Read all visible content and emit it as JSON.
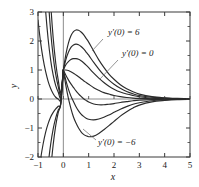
{
  "chart_data": {
    "type": "line",
    "title": "",
    "subtitle": "",
    "xlabel": "x",
    "ylabel": "y",
    "xlim": [
      -1,
      5
    ],
    "ylim": [
      -2,
      3
    ],
    "xticks": [
      "-1",
      "0",
      "1",
      "2",
      "3",
      "4",
      "5"
    ],
    "xtick_values": [
      -1,
      0,
      1,
      2,
      3,
      4,
      5
    ],
    "yticks": [
      "-2",
      "-1",
      "0",
      "1",
      "2",
      "3"
    ],
    "ytick_values": [
      -2,
      -1,
      0,
      1,
      2,
      3
    ],
    "grid": false,
    "legend": "none",
    "common_point": [
      0,
      1
    ],
    "annotations": [
      {
        "id": "slope-plus-six",
        "text": "y'(0) = 6",
        "text_x": 108,
        "text_y": 35,
        "leader": [
          [
            103,
            39
          ],
          [
            92,
            51
          ]
        ]
      },
      {
        "id": "slope-zero",
        "text": "y'(0) = 0",
        "text_x": 122,
        "text_y": 56,
        "leader": [
          [
            118,
            60
          ],
          [
            100,
            79
          ]
        ]
      },
      {
        "id": "slope-minus-six",
        "text": "y'(0) = −6",
        "text_x": 98,
        "text_y": 145,
        "leader": [
          [
            96,
            140
          ],
          [
            83,
            129
          ]
        ]
      }
    ],
    "series": [
      {
        "name": "y'(0) = 6",
        "slope": 6,
        "x": [
          -1.0,
          -0.9,
          -0.8,
          -0.7,
          -0.6,
          -0.5,
          -0.4,
          -0.3,
          -0.2,
          -0.1,
          0.0,
          0.1,
          0.2,
          0.3,
          0.4,
          0.5,
          0.6,
          0.7,
          0.8,
          0.9,
          1.0,
          1.2,
          1.4,
          1.6,
          1.8,
          2.0,
          2.25,
          2.5,
          2.75,
          3.0,
          3.5,
          4.0,
          4.5,
          5.0
        ],
        "y": [
          -13.73,
          -10.21,
          -7.46,
          -5.32,
          -3.7,
          -2.47,
          -1.57,
          -0.92,
          -0.46,
          -0.15,
          1.0,
          1.54,
          1.93,
          2.18,
          2.32,
          2.38,
          2.37,
          2.31,
          2.22,
          2.09,
          1.96,
          1.65,
          1.35,
          1.09,
          0.86,
          0.68,
          0.49,
          0.35,
          0.25,
          0.17,
          0.08,
          0.04,
          0.02,
          0.01
        ]
      },
      {
        "name": "y'(0) = 4",
        "slope": 4,
        "x": [
          -1.0,
          -0.9,
          -0.8,
          -0.7,
          -0.6,
          -0.5,
          -0.4,
          -0.3,
          -0.2,
          -0.1,
          0.0,
          0.1,
          0.2,
          0.3,
          0.4,
          0.5,
          0.6,
          0.7,
          0.8,
          0.9,
          1.0,
          1.2,
          1.4,
          1.6,
          1.8,
          2.0,
          2.25,
          2.5,
          2.75,
          3.0,
          3.5,
          4.0,
          4.5,
          5.0
        ],
        "y": [
          -8.25,
          -6.15,
          -4.51,
          -3.24,
          -2.28,
          -1.56,
          -1.03,
          -0.65,
          -0.38,
          -0.17,
          1.0,
          1.36,
          1.61,
          1.78,
          1.86,
          1.89,
          1.87,
          1.81,
          1.73,
          1.62,
          1.51,
          1.26,
          1.03,
          0.82,
          0.65,
          0.51,
          0.37,
          0.26,
          0.18,
          0.12,
          0.06,
          0.03,
          0.01,
          0.01
        ]
      },
      {
        "name": "y'(0) = 2",
        "slope": 2,
        "x": [
          -1.0,
          -0.9,
          -0.8,
          -0.7,
          -0.6,
          -0.5,
          -0.4,
          -0.3,
          -0.2,
          -0.1,
          0.0,
          0.1,
          0.2,
          0.3,
          0.4,
          0.5,
          0.6,
          0.7,
          0.8,
          0.9,
          1.0,
          1.2,
          1.4,
          1.6,
          1.8,
          2.0,
          2.25,
          2.5,
          2.75,
          3.0,
          3.5,
          4.0,
          4.5,
          5.0
        ],
        "y": [
          -2.78,
          -2.09,
          -1.56,
          -1.15,
          -0.85,
          -0.62,
          -0.46,
          -0.34,
          -0.25,
          -0.14,
          1.0,
          1.18,
          1.29,
          1.36,
          1.39,
          1.39,
          1.37,
          1.32,
          1.25,
          1.17,
          1.08,
          0.89,
          0.72,
          0.57,
          0.44,
          0.34,
          0.24,
          0.17,
          0.12,
          0.08,
          0.03,
          0.02,
          0.01,
          0.0
        ]
      },
      {
        "name": "y'(0) = 0",
        "slope": 0,
        "x": [
          -1.0,
          -0.9,
          -0.8,
          -0.7,
          -0.6,
          -0.5,
          -0.4,
          -0.3,
          -0.2,
          -0.1,
          0.0,
          0.1,
          0.2,
          0.3,
          0.4,
          0.5,
          0.6,
          0.7,
          0.8,
          0.9,
          1.0,
          1.2,
          1.4,
          1.6,
          1.8,
          2.0,
          2.25,
          2.5,
          2.75,
          3.0,
          3.5,
          4.0,
          4.5,
          5.0
        ],
        "y": [
          2.72,
          1.97,
          1.39,
          0.95,
          0.61,
          0.36,
          0.18,
          0.06,
          0.0,
          0.0,
          1.0,
          1.0,
          0.98,
          0.94,
          0.89,
          0.83,
          0.77,
          0.7,
          0.63,
          0.57,
          0.51,
          0.39,
          0.3,
          0.22,
          0.17,
          0.12,
          0.08,
          0.05,
          0.03,
          0.02,
          0.01,
          0.0,
          0.0,
          0.0
        ]
      },
      {
        "name": "y'(0) = -2",
        "slope": -2,
        "x": [
          -1.0,
          -0.9,
          -0.8,
          -0.7,
          -0.6,
          -0.5,
          -0.4,
          -0.3,
          -0.2,
          -0.1,
          0.0,
          0.1,
          0.2,
          0.3,
          0.4,
          0.5,
          0.6,
          0.7,
          0.8,
          0.9,
          1.0,
          1.2,
          1.4,
          1.6,
          1.8,
          2.0,
          2.25,
          2.5,
          2.75,
          3.0,
          3.5,
          4.0,
          4.5,
          5.0
        ],
        "y": [
          8.22,
          6.03,
          4.34,
          3.05,
          2.07,
          1.34,
          0.82,
          0.46,
          0.23,
          0.07,
          1.0,
          0.82,
          0.66,
          0.52,
          0.4,
          0.28,
          0.18,
          0.09,
          0.01,
          -0.05,
          -0.1,
          -0.17,
          -0.2,
          -0.2,
          -0.18,
          -0.16,
          -0.12,
          -0.09,
          -0.06,
          -0.04,
          -0.02,
          -0.01,
          0.0,
          0.0
        ]
      },
      {
        "name": "y'(0) = -4",
        "slope": -4,
        "x": [
          -1.0,
          -0.9,
          -0.8,
          -0.7,
          -0.6,
          -0.5,
          -0.4,
          -0.3,
          -0.2,
          -0.1,
          0.0,
          0.1,
          0.2,
          0.3,
          0.4,
          0.5,
          0.6,
          0.7,
          0.8,
          0.9,
          1.0,
          1.2,
          1.4,
          1.6,
          1.8,
          2.0,
          2.25,
          2.5,
          2.75,
          3.0,
          3.5,
          4.0,
          4.5,
          5.0
        ],
        "y": [
          13.7,
          10.09,
          7.29,
          5.15,
          3.53,
          2.33,
          1.46,
          0.85,
          0.43,
          0.15,
          1.0,
          0.64,
          0.34,
          0.1,
          -0.09,
          -0.27,
          -0.41,
          -0.52,
          -0.6,
          -0.66,
          -0.7,
          -0.72,
          -0.69,
          -0.63,
          -0.55,
          -0.46,
          -0.35,
          -0.26,
          -0.18,
          -0.13,
          -0.06,
          -0.03,
          -0.01,
          0.0
        ]
      },
      {
        "name": "y'(0) = -6",
        "slope": -6,
        "x": [
          -1.0,
          -0.9,
          -0.8,
          -0.7,
          -0.6,
          -0.5,
          -0.4,
          -0.3,
          -0.2,
          -0.1,
          0.0,
          0.1,
          0.2,
          0.3,
          0.4,
          0.5,
          0.6,
          0.7,
          0.8,
          0.9,
          1.0,
          1.2,
          1.4,
          1.6,
          1.8,
          2.0,
          2.25,
          2.5,
          2.75,
          3.0,
          3.5,
          4.0,
          4.5,
          5.0
        ],
        "y": [
          19.18,
          14.15,
          10.24,
          7.25,
          5.0,
          3.31,
          2.1,
          1.24,
          0.64,
          0.22,
          1.0,
          0.46,
          0.02,
          -0.33,
          -0.62,
          -0.83,
          -1.0,
          -1.13,
          -1.22,
          -1.27,
          -1.3,
          -1.28,
          -1.19,
          -1.06,
          -0.92,
          -0.77,
          -0.59,
          -0.44,
          -0.31,
          -0.21,
          -0.1,
          -0.05,
          -0.02,
          -0.01
        ]
      }
    ]
  },
  "colors": {
    "curve": "#2b2b2b",
    "frame": "#3a3a3a",
    "zero_line": "#8c8c8c",
    "leader": "#7a7a7a",
    "background": "#ffffff"
  }
}
